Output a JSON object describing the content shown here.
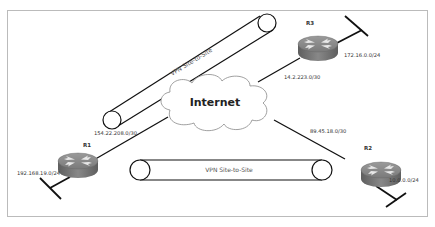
{
  "diagram": {
    "cloud": {
      "label": "Internet"
    },
    "routers": [
      {
        "id": "R1",
        "label": "R1",
        "lan": "192.168.19.0/24",
        "wan": "154.22.208.0/30"
      },
      {
        "id": "R2",
        "label": "R2",
        "lan": "10.0.0.0/24",
        "wan": "89.45.18.0/30"
      },
      {
        "id": "R3",
        "label": "R3",
        "lan": "172.16.0.0/24",
        "wan": "14.2.223.0/30"
      }
    ],
    "tunnels": [
      {
        "label": "VPN Site-to-Site",
        "between": "R1-R3"
      },
      {
        "label": "VPN Site-to-Site",
        "between": "R1-R2"
      }
    ],
    "colors": {
      "router_top": "#8a8a8a",
      "router_side": "#6e6e6e",
      "line": "#111111",
      "border": "#bbbbbb"
    }
  }
}
